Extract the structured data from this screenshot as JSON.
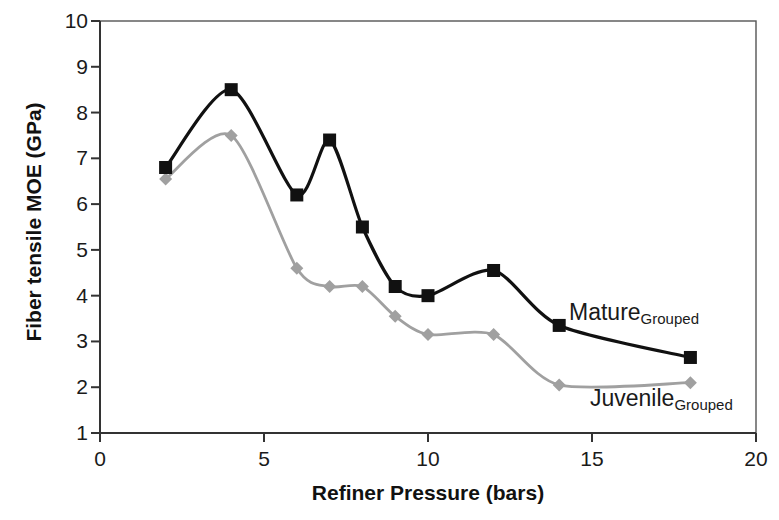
{
  "chart_data": {
    "type": "line",
    "title": "",
    "xlabel": "Refiner Pressure (bars)",
    "ylabel": "Fiber tensile MOE (GPa)",
    "xlim": [
      0,
      20
    ],
    "ylim": [
      1,
      10
    ],
    "xticks": [
      "0",
      "5",
      "10",
      "15",
      "20"
    ],
    "yticks": [
      "1",
      "2",
      "3",
      "4",
      "5",
      "6",
      "7",
      "8",
      "9",
      "10"
    ],
    "grid": false,
    "legend_position": "inline-annotation",
    "series": [
      {
        "name": "Mature",
        "name_subscript": "Grouped",
        "color": "#111111",
        "marker": "square",
        "x": [
          2,
          4,
          6,
          7,
          8,
          9,
          10,
          12,
          14,
          18
        ],
        "values": [
          6.8,
          8.5,
          6.2,
          7.4,
          5.5,
          4.2,
          4.0,
          4.55,
          3.35,
          2.65
        ]
      },
      {
        "name": "Juvenile",
        "name_subscript": "Grouped",
        "color": "#a0a0a0",
        "marker": "diamond",
        "x": [
          2,
          4,
          6,
          7,
          8,
          9,
          10,
          12,
          14,
          18
        ],
        "values": [
          6.55,
          7.5,
          4.6,
          4.2,
          4.2,
          3.55,
          3.15,
          3.15,
          2.05,
          2.1
        ]
      }
    ]
  },
  "axis": {
    "y_title": "Fiber tensile MOE (GPa)",
    "x_title": "Refiner Pressure (bars)",
    "y_ticks": [
      "10",
      "9",
      "8",
      "7",
      "6",
      "5",
      "4",
      "3",
      "2",
      "1"
    ],
    "x_ticks": [
      "0",
      "5",
      "10",
      "15",
      "20"
    ]
  },
  "annotations": {
    "mature_label": "Mature",
    "mature_sub": "Grouped",
    "juvenile_label": "Juvenile",
    "juvenile_sub": "Grouped"
  },
  "colors": {
    "mature": "#111111",
    "juvenile": "#a0a0a0",
    "axis": "#555555",
    "text": "#1a1a1a"
  }
}
